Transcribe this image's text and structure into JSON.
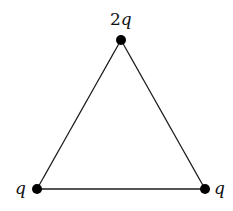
{
  "diagram": {
    "type": "equilateral-triangle-charges",
    "charges": [
      {
        "id": "top",
        "coef": "2",
        "symbol": "q",
        "x": 121,
        "y": 40
      },
      {
        "id": "left",
        "coef": "",
        "symbol": "q",
        "x": 37,
        "y": 189
      },
      {
        "id": "right",
        "coef": "",
        "symbol": "q",
        "x": 205,
        "y": 189
      }
    ],
    "colors": {
      "line": "#1a1a1a",
      "dot": "#000000",
      "background": "#ffffff"
    }
  }
}
